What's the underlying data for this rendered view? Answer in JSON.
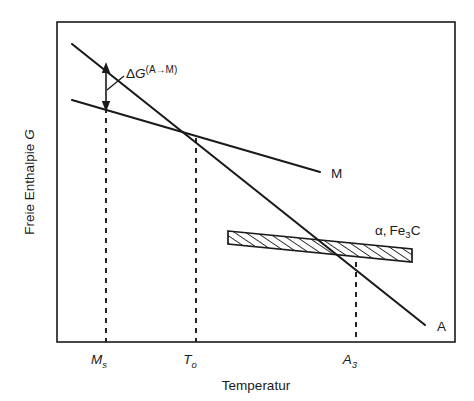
{
  "figure": {
    "type": "schematic-line-diagram",
    "background_color": "#ffffff",
    "ink_color": "#1a1a1a",
    "frame": {
      "x": 57,
      "y": 22,
      "width": 398,
      "height": 320
    }
  },
  "axes": {
    "x_axis_label": "Temperatur",
    "y_axis_label": "Freie Enthalpie G",
    "y_axis_label_plain": "Freie Enthalpie",
    "y_axis_label_italic_symbol": "G",
    "x_ticks": [
      {
        "id": "ms",
        "label": "M",
        "subscript": "s",
        "x": 106
      },
      {
        "id": "to",
        "label": "T",
        "subscript": "o",
        "x": 196
      },
      {
        "id": "a3",
        "label": "A",
        "subscript": "3",
        "x": 356
      }
    ]
  },
  "curves": [
    {
      "id": "line-a",
      "label": "A",
      "description": "Austenite free enthalpy line, steeper negative slope",
      "x1": 72,
      "y1": 44,
      "x2": 425,
      "y2": 325,
      "label_x": 437,
      "label_y": 330
    },
    {
      "id": "line-m",
      "label": "M",
      "description": "Martensite free enthalpy line, shallower negative slope",
      "x1": 72,
      "y1": 100,
      "x2": 320,
      "y2": 172,
      "label_x": 331,
      "label_y": 177
    }
  ],
  "band": {
    "id": "alpha-fe3c-band",
    "label": "α, Fe3C",
    "label_alpha": "α,",
    "label_fe": "Fe",
    "label_sub": "3",
    "label_c": "C",
    "hatching": "diagonal-forward-slash",
    "label_x": 375,
    "label_y": 232,
    "top_left": {
      "x": 228,
      "y": 231
    },
    "top_right": {
      "x": 412,
      "y": 249
    },
    "bottom_left": {
      "x": 228,
      "y": 244
    },
    "bottom_right": {
      "x": 412,
      "y": 262
    }
  },
  "annotation": {
    "id": "delta-g-annotation",
    "text": "ΔG(A→M)",
    "delta_symbol": "Δ",
    "g_symbol": "G",
    "superscript": "(A→M)",
    "text_x": 126,
    "text_y": 73,
    "arrow": {
      "x": 106,
      "y_top": 66,
      "y_bottom": 109,
      "double_headed": true
    },
    "leader": {
      "x1": 123,
      "y1": 76,
      "x2": 108,
      "y2": 90
    }
  },
  "intersections": [
    {
      "id": "t0-crossing",
      "x": 196,
      "y": 138,
      "description": "A and M lines cross at T_o"
    },
    {
      "id": "a3-crossing",
      "x": 356,
      "y": 262,
      "description": "A line crosses lower edge of alpha+Fe3C band at A_3"
    }
  ],
  "dashed_lines": [
    {
      "id": "dash-ms",
      "x": 106,
      "y_top": 108,
      "y_bottom": 342
    },
    {
      "id": "dash-to",
      "x": 196,
      "y_top": 138,
      "y_bottom": 342
    },
    {
      "id": "dash-a3",
      "x": 356,
      "y_top": 262,
      "y_bottom": 342
    }
  ]
}
